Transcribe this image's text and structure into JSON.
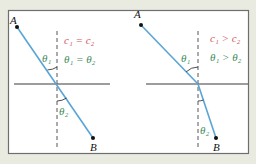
{
  "figure": {
    "colors": {
      "background": "#e9ebe1",
      "panel": "#ffffff",
      "border": "#6e6e6e",
      "ray": "#5aa5d6",
      "interface": "#3a3a3a",
      "normal": "#444444",
      "speed_relation": "#d0555c",
      "angle_relation": "#3d8c5a",
      "angle_label": "#3d8c5a",
      "point": "#111111"
    }
  },
  "panels": [
    {
      "id": "left",
      "point_a_label": "A",
      "point_b_label": "B",
      "speed_relation": "c₁ = c₂",
      "angle_relation": "θ₁ = θ₂",
      "theta1_label": "θ₁",
      "theta2_label": "θ₂"
    },
    {
      "id": "right",
      "point_a_label": "A",
      "point_b_label": "B",
      "speed_relation": "c₁ > c₂",
      "angle_relation": "θ₁ > θ₂",
      "theta1_label": "θ₁",
      "theta2_label": "θ₂"
    }
  ]
}
